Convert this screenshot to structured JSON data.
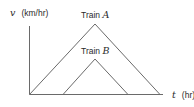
{
  "diagram": {
    "y_axis": {
      "variable": "v",
      "units": "(km/hr)"
    },
    "x_axis": {
      "variable": "t",
      "units": "(hr)"
    },
    "curves": [
      {
        "label_prefix": "Train ",
        "label_var": "A",
        "start_x": 29,
        "peak_x": 95,
        "peak_y": 24,
        "end_x": 160
      },
      {
        "label_prefix": "Train ",
        "label_var": "B",
        "start_x": 63,
        "peak_x": 95,
        "peak_y": 59,
        "end_x": 128
      }
    ],
    "colors": {
      "line": "#6a6a6a",
      "text": "#2a2a2a"
    }
  }
}
